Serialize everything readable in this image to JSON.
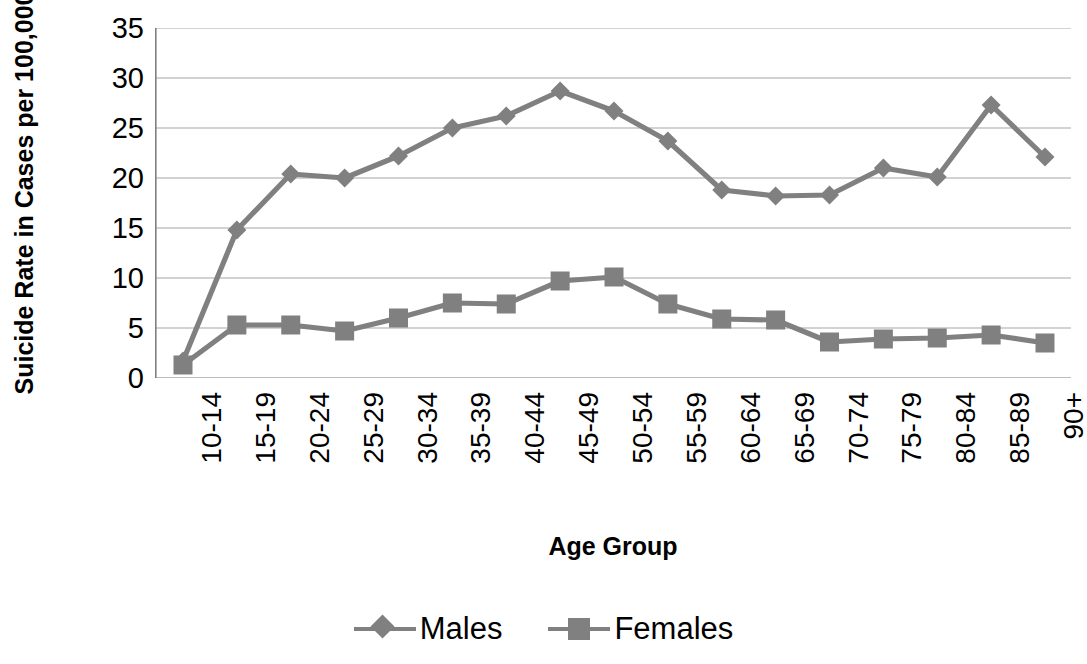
{
  "chart_data": {
    "type": "line",
    "title": "",
    "xlabel": "Age Group",
    "ylabel": "Suicide Rate  in Cases per 100,000",
    "categories": [
      "10-14",
      "15-19",
      "20-24",
      "25-29",
      "30-34",
      "35-39",
      "40-44",
      "45-49",
      "50-54",
      "55-59",
      "60-64",
      "65-69",
      "70-74",
      "75-79",
      "80-84",
      "85-89",
      "90+"
    ],
    "series": [
      {
        "name": "Males",
        "marker": "diamond",
        "color": "#808080",
        "values": [
          1.7,
          14.8,
          20.4,
          20.0,
          22.2,
          25.0,
          26.2,
          28.7,
          26.7,
          23.7,
          18.8,
          18.2,
          18.3,
          21.0,
          20.1,
          27.3,
          22.1
        ]
      },
      {
        "name": "Females",
        "marker": "square",
        "color": "#808080",
        "values": [
          1.3,
          5.3,
          5.3,
          4.7,
          6.0,
          7.5,
          7.4,
          9.7,
          10.1,
          7.4,
          5.9,
          5.8,
          3.6,
          3.9,
          4.0,
          4.3,
          3.5
        ]
      }
    ],
    "ylim": [
      0,
      35
    ],
    "yticks": [
      0,
      5,
      10,
      15,
      20,
      25,
      30,
      35
    ],
    "ytick_labels": [
      "0",
      "5",
      "10",
      "15",
      "20",
      "25",
      "30",
      "35"
    ],
    "grid": "horizontal",
    "grid_color": "#a6a6a6",
    "axis_color": "#808080",
    "legend_position": "bottom"
  },
  "legend": {
    "entries": [
      {
        "label": "Males",
        "icon": "diamond-marker-icon"
      },
      {
        "label": "Females",
        "icon": "square-marker-icon"
      }
    ]
  }
}
